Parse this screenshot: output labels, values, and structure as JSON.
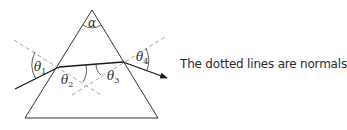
{
  "diagram": {
    "type": "prism-refraction",
    "caption": "The dotted lines are normals",
    "labels": {
      "apex_angle": "α",
      "theta1": {
        "symbol": "θ",
        "sub": "1"
      },
      "theta2": {
        "symbol": "θ",
        "sub": "2"
      },
      "theta3": {
        "symbol": "θ",
        "sub": "3"
      },
      "theta4": {
        "symbol": "θ",
        "sub": "4"
      }
    },
    "colors": {
      "prism_stroke": "#333333",
      "ray_stroke": "#1a1a1a",
      "normal_stroke": "#8a8a8a",
      "text": "#2a2a2a"
    }
  }
}
